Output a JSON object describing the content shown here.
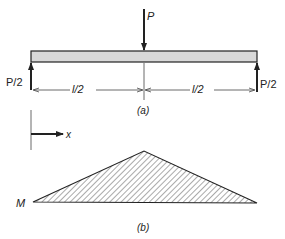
{
  "figure_a": {
    "load_label": "P",
    "left_reaction_label": "P/2",
    "right_reaction_label": "P/2",
    "left_span_label": "l/2",
    "right_span_label": "l/2",
    "caption": "(a)"
  },
  "figure_b": {
    "axis_label": "x",
    "moment_label": "M",
    "caption": "(b)"
  },
  "colors": {
    "line": "#222222",
    "beam_fill": "#d8d8d8",
    "hatch": "#555555"
  }
}
